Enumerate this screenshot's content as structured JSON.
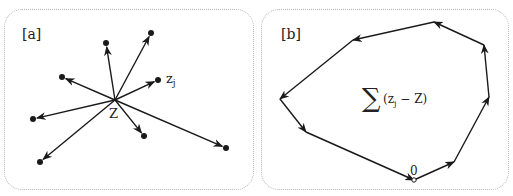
{
  "panels": {
    "a": {
      "label": "[a]",
      "center_label": "Z",
      "point_label": "z",
      "point_label_sub": "j",
      "center": [
        115,
        100
      ],
      "points": [
        [
          106,
          43
        ],
        [
          151,
          33
        ],
        [
          62,
          77
        ],
        [
          158,
          80
        ],
        [
          33,
          119
        ],
        [
          40,
          162
        ],
        [
          144,
          136
        ],
        [
          226,
          148
        ]
      ]
    },
    "b": {
      "label": "[b]",
      "origin_label": "0",
      "sum_symbol": "∑",
      "sum_expr": "(z",
      "sum_sub": "j",
      "sum_rest": " − Z)",
      "vertices": [
        [
          414,
          180
        ],
        [
          454,
          162
        ],
        [
          489,
          97
        ],
        [
          484,
          45
        ],
        [
          434,
          22
        ],
        [
          353,
          40
        ],
        [
          280,
          99
        ],
        [
          306,
          132
        ]
      ]
    }
  },
  "colors": {
    "line": "#1a1a1a",
    "border": "#b8b8b8",
    "text": "#222222"
  }
}
